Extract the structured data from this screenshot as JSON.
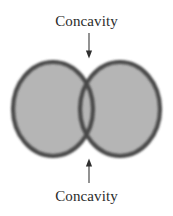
{
  "figure": {
    "background_color": "#ffffff",
    "annotations": {
      "top_label": "Concavity",
      "bottom_label": "Concavity"
    },
    "arrows": [
      {
        "name": "top-arrow",
        "direction": "down",
        "x": 89,
        "y_start": 33,
        "y_end": 57,
        "color": "#3a3a3a"
      },
      {
        "name": "bottom-arrow",
        "direction": "up",
        "x": 89,
        "y_start": 183,
        "y_end": 160,
        "color": "#3a3a3a"
      }
    ],
    "shapes": {
      "type": "two-overlapping-circles",
      "fill_color": "#b5b5b5",
      "border_color": "#4a4a4a",
      "border_width": 4,
      "circles": [
        {
          "name": "left-circle",
          "cx": 53,
          "cy": 109,
          "rx": 42,
          "ry": 49
        },
        {
          "name": "right-circle",
          "cx": 120,
          "cy": 109,
          "rx": 42,
          "ry": 49
        }
      ],
      "concavity_points": [
        {
          "name": "top-concavity",
          "x": 88,
          "y": 62
        },
        {
          "name": "bottom-concavity",
          "x": 88,
          "y": 156
        }
      ]
    }
  }
}
